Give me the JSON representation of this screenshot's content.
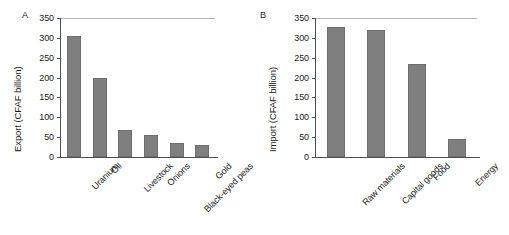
{
  "figure": {
    "background_color": "#ffffff",
    "bar_color": "#7f7f7f",
    "axis_color": "#4d4d4d"
  },
  "panels": [
    {
      "letter": "A",
      "ylabel": "Export (CFAF billion)",
      "yticks": [
        "0",
        "50",
        "100",
        "150",
        "200",
        "250",
        "300",
        "350"
      ],
      "categories": [
        "Uranium",
        "Oil",
        "Livestock",
        "Onions",
        "Black-eyed peas",
        "Gold"
      ],
      "values": [
        305,
        200,
        67,
        55,
        35,
        30
      ]
    },
    {
      "letter": "B",
      "ylabel": "Import (CFAF billion)",
      "yticks": [
        "0",
        "50",
        "100",
        "150",
        "200",
        "250",
        "300",
        "350"
      ],
      "categories": [
        "Raw materials",
        "Capital goods",
        "Food",
        "Energy"
      ],
      "values": [
        327,
        320,
        235,
        45
      ]
    }
  ],
  "chart_data": [
    {
      "type": "bar",
      "title": "A",
      "categories": [
        "Uranium",
        "Oil",
        "Livestock",
        "Onions",
        "Black-eyed peas",
        "Gold"
      ],
      "values": [
        305,
        200,
        67,
        55,
        35,
        30
      ],
      "xlabel": "",
      "ylabel": "Export (CFAF billion)",
      "ylim": [
        0,
        350
      ],
      "ytick_values": [
        0,
        50,
        100,
        150,
        200,
        250,
        300,
        350
      ],
      "grid": false,
      "legend": "none",
      "series": [
        {
          "name": "Export (CFAF billion)",
          "values": [
            305,
            200,
            67,
            55,
            35,
            30
          ]
        }
      ]
    },
    {
      "type": "bar",
      "title": "B",
      "categories": [
        "Raw materials",
        "Capital goods",
        "Food",
        "Energy"
      ],
      "values": [
        327,
        320,
        235,
        45
      ],
      "xlabel": "",
      "ylabel": "Import (CFAF billion)",
      "ylim": [
        0,
        350
      ],
      "ytick_values": [
        0,
        50,
        100,
        150,
        200,
        250,
        300,
        350
      ],
      "grid": false,
      "legend": "none",
      "series": [
        {
          "name": "Import (CFAF billion)",
          "values": [
            327,
            320,
            235,
            45
          ]
        }
      ]
    }
  ]
}
